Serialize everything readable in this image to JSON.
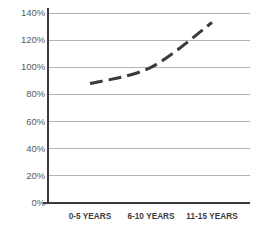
{
  "chart_data": {
    "type": "line",
    "title": "",
    "subtitle": "",
    "xlabel": "",
    "ylabel": "",
    "categories": [
      "0-5 YEARS",
      "6-10 YEARS",
      "11-15 YEARS"
    ],
    "values": [
      88,
      100,
      133
    ],
    "series": [
      {
        "name": "",
        "values": [
          88,
          100,
          133
        ],
        "style": "dashed",
        "color": "#3a3a3c",
        "line_width": 3,
        "dash_pattern": "13 6",
        "markers": false,
        "smooth": true
      }
    ],
    "ylim": [
      0,
      140
    ],
    "y_tick_step": 20,
    "y_ticks": [
      0,
      20,
      40,
      60,
      80,
      100,
      120,
      140
    ],
    "y_tick_labels": [
      "0%",
      "20%",
      "40%",
      "60%",
      "80%",
      "100%",
      "120%",
      "140%"
    ],
    "y_tick_suffix": "%",
    "x_ticks": [
      "0-5 YEARS",
      "6-10 YEARS",
      "11-15 YEARS"
    ],
    "grid": {
      "horizontal": true,
      "vertical": false,
      "color": "#b3b3b5"
    },
    "legend": {
      "visible": false,
      "position": "none",
      "entries": []
    },
    "axes": {
      "y_axis_visible": true,
      "y_axis_color": "#3a3a3c",
      "x_axis_visible": true,
      "x_axis_color": "#3a3a3c",
      "tick_marks": true
    },
    "annotations": [],
    "background_color": "#ffffff"
  }
}
